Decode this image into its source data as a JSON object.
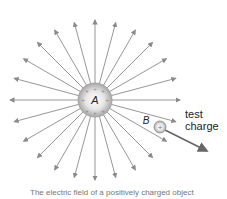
{
  "diagram": {
    "center_charge": {
      "label": "A",
      "sign": "+",
      "cx": 95,
      "cy": 100,
      "r": 17
    },
    "test_charge": {
      "label": "B",
      "sign": "+",
      "cx": 160,
      "cy": 127,
      "r": 6
    },
    "test_label": [
      "test",
      "charge"
    ],
    "field_line_count": 24,
    "colors": {
      "line": "#8a8a8a",
      "sphere": "#bdbdbd",
      "text": "#222222"
    },
    "caption": "The electric field of a positively charged object"
  }
}
